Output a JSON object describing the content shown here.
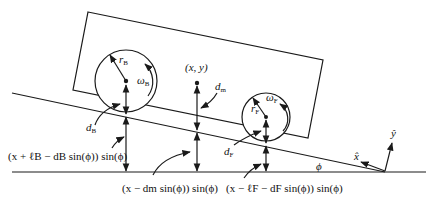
{
  "figure": {
    "type": "free-body diagram"
  },
  "labels": {
    "rear_radius": "r",
    "rear_radius_sub": "B",
    "rear_omega": "ω",
    "rear_omega_sub": "B",
    "front_radius": "r",
    "front_radius_sub": "F",
    "front_omega": "ω",
    "front_omega_sub": "F",
    "com": "(x, y)",
    "dm": "d",
    "dm_sub": "m",
    "dB": "d",
    "dB_sub": "B",
    "dF": "d",
    "dF_sub": "F",
    "phi": "ϕ",
    "x_hat": "x̂",
    "y_hat": "ŷ",
    "rear_height_expr": "(x + ℓB − dB sin(ϕ)) sin(ϕ)",
    "center_height_expr": "(x − dm sin(ϕ)) sin(ϕ)",
    "front_height_expr": "(x − ℓF − dF sin(ϕ)) sin(ϕ)"
  },
  "colors": {
    "stroke": "#1a1a1a",
    "background": "#ffffff"
  }
}
